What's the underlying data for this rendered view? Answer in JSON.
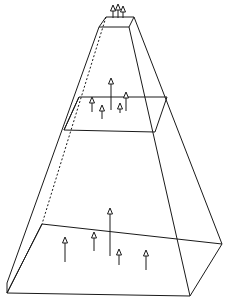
{
  "diagram": {
    "type": "frustum-with-layers",
    "colors": {
      "stroke": "#1a1a1a",
      "background": "#ffffff"
    },
    "levels": [
      {
        "name": "top-cap",
        "arrows": [
          {
            "x": 113,
            "y1": 18,
            "y2": 5
          },
          {
            "x": 118,
            "y1": 18,
            "y2": 4
          },
          {
            "x": 123,
            "y1": 18,
            "y2": 6
          }
        ]
      },
      {
        "name": "middle-slice",
        "arrows": [
          {
            "x": 92,
            "y1": 112,
            "y2": 97
          },
          {
            "x": 102,
            "y1": 119,
            "y2": 105
          },
          {
            "x": 111,
            "y1": 110,
            "y2": 78
          },
          {
            "x": 120,
            "y1": 113,
            "y2": 103
          },
          {
            "x": 126,
            "y1": 111,
            "y2": 92
          }
        ]
      },
      {
        "name": "bottom-slab",
        "arrows": [
          {
            "x": 65,
            "y1": 262,
            "y2": 237
          },
          {
            "x": 94,
            "y1": 251,
            "y2": 232
          },
          {
            "x": 110,
            "y1": 256,
            "y2": 208
          },
          {
            "x": 119,
            "y1": 265,
            "y2": 249
          },
          {
            "x": 146,
            "y1": 270,
            "y2": 250
          }
        ]
      }
    ]
  }
}
